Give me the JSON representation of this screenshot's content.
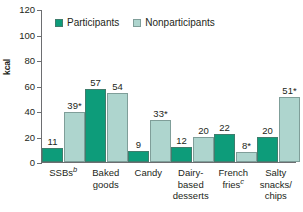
{
  "chart_data": {
    "type": "bar",
    "title": "",
    "xlabel": "",
    "ylabel": "kcal",
    "ylim": [
      0,
      120
    ],
    "yticks": [
      0,
      20,
      40,
      60,
      80,
      100,
      120
    ],
    "grid": false,
    "legend_position": "top-left",
    "categories": [
      "SSBs",
      "Baked goods",
      "Candy",
      "Dairy-based desserts",
      "French fries",
      "Salty snacks/chips"
    ],
    "category_lines": [
      [
        "SSBs"
      ],
      [
        "Baked",
        "goods"
      ],
      [
        "Candy"
      ],
      [
        "Dairy-",
        "based",
        "desserts"
      ],
      [
        "French",
        "fries"
      ],
      [
        "Salty",
        "snacks/",
        "chips"
      ]
    ],
    "category_footnotes": [
      "b",
      "",
      "",
      "",
      "c",
      ""
    ],
    "series": [
      {
        "name": "Participants",
        "color": "#0d9c7a",
        "values": [
          11,
          57,
          9,
          12,
          22,
          20
        ],
        "labels": [
          "11",
          "57",
          "9",
          "12",
          "22",
          "20"
        ]
      },
      {
        "name": "Nonparticipants",
        "color": "#aed5ce",
        "values": [
          39,
          54,
          33,
          20,
          8,
          51
        ],
        "labels": [
          "39*",
          "54",
          "33*",
          "20",
          "8*",
          "51*"
        ]
      }
    ]
  },
  "legend": {
    "items": [
      {
        "label": "Participants"
      },
      {
        "label": "Nonparticipants"
      }
    ]
  },
  "axis": {
    "y_title": "kcal",
    "y_ticks": [
      "120",
      "100",
      "80",
      "60",
      "40",
      "20",
      "0"
    ]
  },
  "colors": {
    "participants": "#0d9c7a",
    "nonparticipants": "#aed5ce",
    "axis": "#6d6e71",
    "text": "#231f20",
    "background": "#ffffff"
  }
}
